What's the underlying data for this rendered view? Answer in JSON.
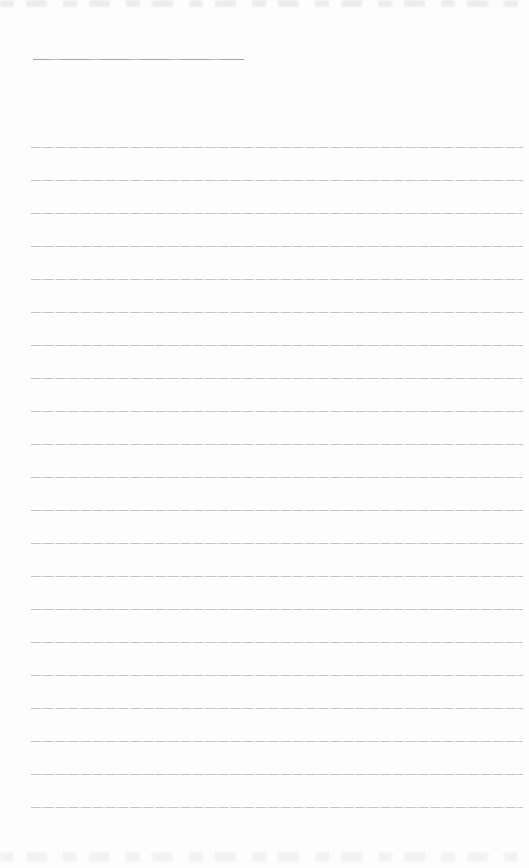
{
  "page": {
    "background_color": "#fdfdfd",
    "content_text": "",
    "edge_texture_color": "#ebebeb"
  },
  "header_rule": {
    "color": "#a8a8a8",
    "left_px": 33,
    "top_px": 59,
    "width_px": 211
  },
  "ruled_lines": {
    "count": 21,
    "first_y_px": 147,
    "spacing_px": 33,
    "left_px": 31,
    "width_px": 492,
    "color": "#c2c2c2"
  }
}
